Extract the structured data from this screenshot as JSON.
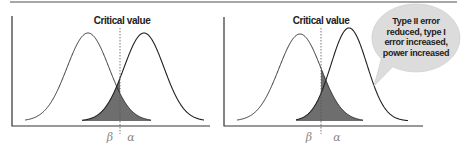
{
  "figure": {
    "top_rule": {
      "x1": 10,
      "x2": 457,
      "y": 2,
      "color": "#8a8a8a"
    },
    "colors": {
      "curve": "#222222",
      "shade": "#6e6e6e",
      "axis": "#333333",
      "critical_line": "#555555",
      "bubble_fill": "#dcdcdc",
      "greek": "#888888"
    },
    "panels": [
      {
        "id": "before",
        "critical_label": "Critical value",
        "beta_label": "β",
        "alpha_label": "α",
        "axis": {
          "x0": 12,
          "y_top": 16,
          "y_base": 126,
          "x_end": 210
        },
        "critical_x": 120,
        "baseline_y": 121,
        "null_curve": {
          "mu": 88,
          "sigma": 21,
          "height": 88,
          "x_from": 25,
          "x_to": 151
        },
        "alt_curve": {
          "mu": 144,
          "sigma": 20,
          "height": 88,
          "x_from": 82,
          "x_to": 204
        },
        "label_positions": {
          "critical": [
            122,
            24
          ],
          "beta": [
            110,
            141
          ],
          "alpha": [
            131,
            141
          ]
        }
      },
      {
        "id": "after",
        "critical_label": "Critical value",
        "beta_label": "β",
        "alpha_label": "α",
        "axis": {
          "x0": 224,
          "y_top": 17,
          "y_base": 126,
          "x_end": 423
        },
        "critical_x": 321,
        "baseline_y": 121,
        "null_curve": {
          "mu": 300,
          "sigma": 21,
          "height": 87,
          "x_from": 237,
          "x_to": 363
        },
        "alt_curve": {
          "mu": 349,
          "sigma": 18,
          "height": 93,
          "x_from": 296,
          "x_to": 408
        },
        "label_positions": {
          "critical": [
            321,
            24
          ],
          "beta": [
            309,
            141
          ],
          "alpha": [
            337,
            141
          ]
        }
      }
    ],
    "callout": {
      "lines": [
        "Type II error",
        "reduced, type I",
        "error increased,",
        "power increased"
      ],
      "center": [
        416,
        38
      ],
      "rx": 44,
      "ry": 34,
      "tail_tip": [
        374,
        86
      ]
    }
  }
}
